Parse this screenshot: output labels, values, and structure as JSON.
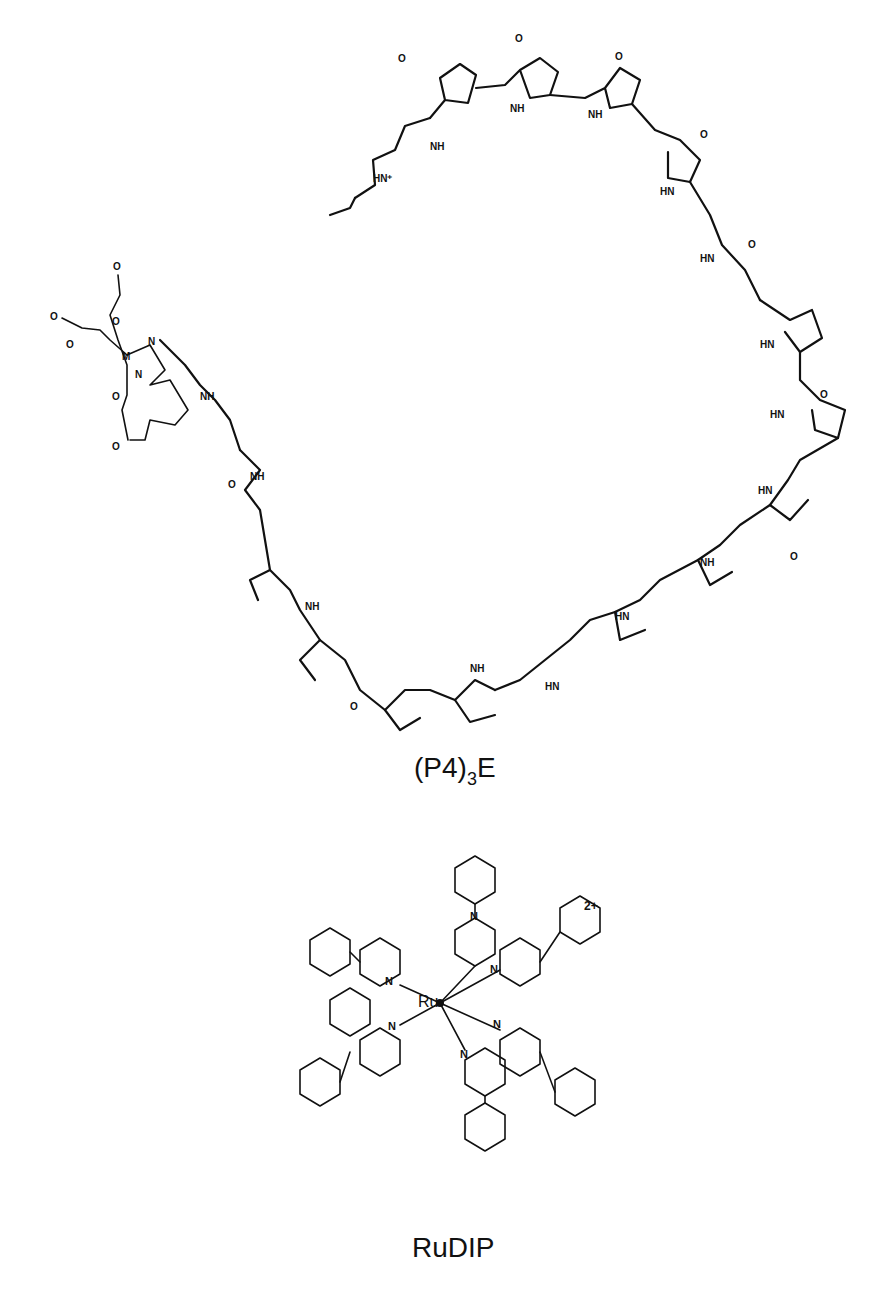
{
  "figure": {
    "molecules": [
      {
        "id": "polyamide-edta",
        "caption_main": "(P4)",
        "caption_sub": "3",
        "caption_tail": "E",
        "atom_labels": {
          "methyl_n": "N",
          "carbonyl_o": "O",
          "amide_nh": "NH",
          "amide_hn": "HN",
          "ammonium": "HN+",
          "metal": "M",
          "edta_n": "N",
          "edta_o": "O"
        },
        "units": {
          "pyrrole_count": 12,
          "beta_alanine_linkers": 2,
          "edta_linker": "butyl"
        }
      },
      {
        "id": "rudip",
        "caption": "RuDIP",
        "charge": "2+",
        "metal_label": "Ru",
        "ligand_n_label": "N",
        "ligand_count": 3
      }
    ]
  }
}
